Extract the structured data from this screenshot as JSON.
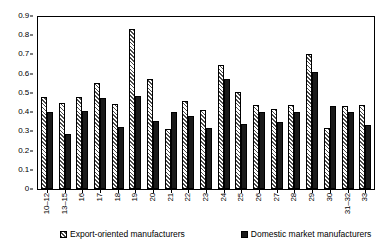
{
  "chart_data": {
    "type": "bar",
    "title": "",
    "subtitle": "",
    "xlabel": "",
    "ylabel": "",
    "ylim": [
      0,
      0.9
    ],
    "ytick_step": 0.1,
    "yticks": [
      "0.9",
      "0.8",
      "0.7",
      "0.6",
      "0.5",
      "0.4",
      "0.3",
      "0.2",
      "0.1",
      "0"
    ],
    "grid": false,
    "legend_position": "bottom",
    "categories": [
      "10–12",
      "13–15",
      "16",
      "17",
      "18",
      "19",
      "20",
      "21",
      "22",
      "23",
      "24",
      "25",
      "26",
      "27",
      "28",
      "29",
      "30",
      "31–32",
      "33"
    ],
    "series": [
      {
        "name": "Export-oriented manufacturers",
        "pattern": "diagonal-hatch",
        "color": "#ffffff",
        "values": [
          0.48,
          0.45,
          0.48,
          0.55,
          0.44,
          0.83,
          0.57,
          0.31,
          0.46,
          0.41,
          0.645,
          0.505,
          0.435,
          0.415,
          0.435,
          0.7,
          0.32,
          0.43,
          0.435
        ]
      },
      {
        "name": "Domestic market manufacturers",
        "pattern": "solid",
        "color": "#1a1a1a",
        "values": [
          0.4,
          0.285,
          0.405,
          0.475,
          0.325,
          0.485,
          0.355,
          0.4,
          0.38,
          0.32,
          0.57,
          0.34,
          0.4,
          0.35,
          0.4,
          0.61,
          0.43,
          0.4,
          0.335
        ]
      }
    ]
  },
  "legend": {
    "items": [
      {
        "label": "Export-oriented manufacturers"
      },
      {
        "label": "Domestic market manufacturers"
      }
    ]
  }
}
